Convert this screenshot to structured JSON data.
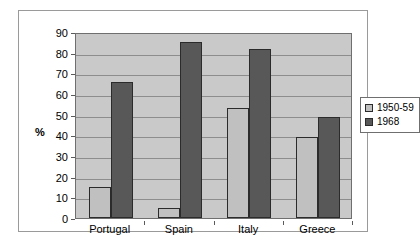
{
  "chart_data": {
    "type": "bar",
    "title": "",
    "xlabel": "",
    "ylabel": "%",
    "ylim": [
      0,
      90
    ],
    "ytick_step": 10,
    "yticks": [
      90,
      80,
      70,
      60,
      50,
      40,
      30,
      20,
      10,
      0
    ],
    "grid": true,
    "legend_position": "right",
    "categories": [
      "Portugal",
      "Spain",
      "Italy",
      "Greece"
    ],
    "series": [
      {
        "name": "1950-59",
        "color": "#C0C0C0",
        "values": [
          15,
          5,
          53,
          39
        ]
      },
      {
        "name": "1968",
        "color": "#585858",
        "values": [
          66,
          85,
          82,
          49
        ]
      }
    ]
  },
  "legend": {
    "entries": [
      {
        "label": "1950-59"
      },
      {
        "label": "1968"
      }
    ]
  },
  "colors": {
    "plot_background": "#C9C9C9",
    "gridline": "#8D8D8D",
    "frame_border": "#9A9A9A",
    "series_1950_59": "#C0C0C0",
    "series_1968": "#585858"
  }
}
